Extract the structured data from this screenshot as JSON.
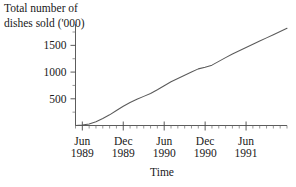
{
  "chart_data": {
    "type": "line",
    "title": "",
    "ylabel": "Total number of\ndishes sold ('000)",
    "xlabel": "Time",
    "grid": false,
    "legend": "none",
    "ylim": [
      0,
      1900
    ],
    "ytick_labels": [
      "500",
      "1000",
      "1500"
    ],
    "ytick_values": [
      500,
      1000,
      1500
    ],
    "y_minor_step": 250,
    "xlim": [
      "1989-05",
      "1991-12"
    ],
    "xtick_labels": [
      {
        "month": "Jun",
        "year": "1989"
      },
      {
        "month": "Dec",
        "year": "1989"
      },
      {
        "month": "Jun",
        "year": "1990"
      },
      {
        "month": "Dec",
        "year": "1990"
      },
      {
        "month": "Jun",
        "year": "1991"
      }
    ],
    "xtick_values": [
      "1989-06",
      "1989-12",
      "1990-06",
      "1990-12",
      "1991-06"
    ],
    "x_minor_unit": "month",
    "series": [
      {
        "name": "Cumulative dishes sold",
        "x": [
          "1989-05",
          "1989-06",
          "1989-07",
          "1989-08",
          "1989-09",
          "1989-10",
          "1989-11",
          "1989-12",
          "1990-01",
          "1990-02",
          "1990-03",
          "1990-04",
          "1990-05",
          "1990-06",
          "1990-07",
          "1990-08",
          "1990-09",
          "1990-10",
          "1990-11",
          "1990-12",
          "1991-01",
          "1991-02",
          "1991-03",
          "1991-04",
          "1991-05",
          "1991-06",
          "1991-07",
          "1991-08",
          "1991-09",
          "1991-10",
          "1991-11",
          "1991-12"
        ],
        "values": [
          0,
          10,
          30,
          70,
          130,
          200,
          280,
          360,
          430,
          490,
          545,
          600,
          670,
          745,
          820,
          880,
          940,
          1000,
          1060,
          1090,
          1130,
          1200,
          1270,
          1340,
          1400,
          1460,
          1520,
          1580,
          1640,
          1700,
          1760,
          1820
        ]
      }
    ],
    "colors": {
      "line": "#5a5a5a",
      "axis": "#4a4a4a",
      "text": "#202020",
      "background": "#ffffff"
    }
  }
}
